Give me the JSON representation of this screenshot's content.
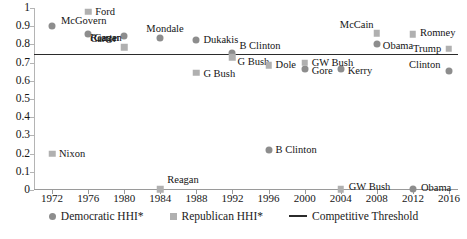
{
  "chart_data": {
    "type": "scatter",
    "title": "",
    "xlabel": "",
    "ylabel": "",
    "xlim": [
      1970,
      2017
    ],
    "ylim": [
      0,
      1
    ],
    "grid": false,
    "legend_position": "bottom",
    "x_ticks": [
      1972,
      1976,
      1980,
      1984,
      1988,
      1992,
      1996,
      2000,
      2004,
      2008,
      2012,
      2016
    ],
    "y_ticks": [
      "0",
      "0.1",
      "0.2",
      "0.3",
      "0.4",
      "0.5",
      "0.6",
      "0.7",
      "0.8",
      "0.9",
      "1"
    ],
    "threshold": {
      "label": "Competitive Threshold",
      "value": 0.745,
      "color": "#2b2b2b"
    },
    "series": [
      {
        "name": "Democratic HHI*",
        "marker": "circle",
        "color": "#8d8d8d",
        "points": [
          {
            "x": 1972,
            "y": 0.9,
            "label": "McGovern",
            "lx": 9,
            "ly": -5
          },
          {
            "x": 1976,
            "y": 0.855,
            "label": "Carter",
            "lx": 6,
            "ly": 4
          },
          {
            "x": 1980,
            "y": 0.845,
            "label": "Carter",
            "lx": -34,
            "ly": 3
          },
          {
            "x": 1984,
            "y": 0.835,
            "label": "Mondale",
            "lx": -14,
            "ly": -9
          },
          {
            "x": 1988,
            "y": 0.825,
            "label": "Dukakis",
            "lx": 7,
            "ly": 0
          },
          {
            "x": 1992,
            "y": 0.755,
            "label": "B Clinton",
            "lx": 7,
            "ly": -7
          },
          {
            "x": 1996,
            "y": 0.22,
            "label": "B Clinton",
            "lx": 7,
            "ly": 0
          },
          {
            "x": 2000,
            "y": 0.665,
            "label": "Gore",
            "lx": 7,
            "ly": 2
          },
          {
            "x": 2004,
            "y": 0.665,
            "label": "Kerry",
            "lx": 7,
            "ly": 2
          },
          {
            "x": 2008,
            "y": 0.8,
            "label": "Obama",
            "lx": 6,
            "ly": 2
          },
          {
            "x": 2012,
            "y": 0.005,
            "label": "Obama",
            "lx": 8,
            "ly": -1
          },
          {
            "x": 2016,
            "y": 0.655,
            "label": "Clinton",
            "lx": -40,
            "ly": -6
          }
        ]
      },
      {
        "name": "Republican HHI*",
        "marker": "square",
        "color": "#b0b0b0",
        "points": [
          {
            "x": 1972,
            "y": 0.2,
            "label": "Nixon",
            "lx": 7,
            "ly": 0
          },
          {
            "x": 1976,
            "y": 0.98,
            "label": "Ford",
            "lx": 7,
            "ly": 0
          },
          {
            "x": 1980,
            "y": 0.785,
            "label": "Reagan",
            "lx": -34,
            "ly": -9
          },
          {
            "x": 1984,
            "y": 0.005,
            "label": "Reagan",
            "lx": 7,
            "ly": -9
          },
          {
            "x": 1988,
            "y": 0.645,
            "label": "G Bush",
            "lx": 7,
            "ly": 1
          },
          {
            "x": 1992,
            "y": 0.73,
            "label": "G Bush",
            "lx": 5,
            "ly": 5
          },
          {
            "x": 1996,
            "y": 0.685,
            "label": "Dole",
            "lx": 7,
            "ly": 0
          },
          {
            "x": 2000,
            "y": 0.7,
            "label": "GW Bush",
            "lx": 7,
            "ly": 0
          },
          {
            "x": 2004,
            "y": 0.005,
            "label": "GW Bush",
            "lx": 8,
            "ly": -2
          },
          {
            "x": 2008,
            "y": 0.86,
            "label": "McCain",
            "lx": -37,
            "ly": -8
          },
          {
            "x": 2012,
            "y": 0.855,
            "label": "Romney",
            "lx": 7,
            "ly": -1
          },
          {
            "x": 2016,
            "y": 0.775,
            "label": "Trump",
            "lx": -36,
            "ly": 0
          }
        ]
      }
    ]
  },
  "legend": {
    "items": [
      {
        "label": "Democratic HHI*",
        "marker": "circle"
      },
      {
        "label": "Republican HHI*",
        "marker": "square"
      },
      {
        "label": "Competitive Threshold",
        "marker": "line"
      }
    ]
  },
  "footnote": {
    "text": ""
  }
}
